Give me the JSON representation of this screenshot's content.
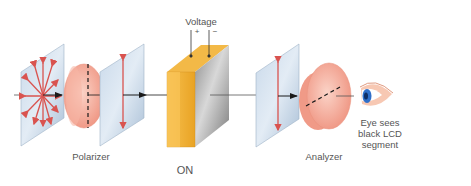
{
  "diagram": {
    "state_label": "ON",
    "labels": {
      "voltage": "Voltage",
      "plus": "+",
      "minus": "−",
      "polarizer": "Polarizer",
      "analyzer": "Analyzer",
      "eye_line1": "Eye sees",
      "eye_line2": "black LCD",
      "eye_line3": "segment"
    },
    "components": [
      {
        "name": "unpolarized-light-panel",
        "position": 1
      },
      {
        "name": "polarizer-lens",
        "axis": "vertical",
        "position": 2
      },
      {
        "name": "vertically-polarized-panel",
        "position": 3
      },
      {
        "name": "liquid-crystal-cell",
        "state": "voltage on",
        "position": 4
      },
      {
        "name": "vertically-polarized-panel-2",
        "position": 5
      },
      {
        "name": "analyzer-lens",
        "axis": "diagonal/horizontal",
        "position": 6
      },
      {
        "name": "eye",
        "position": 7
      }
    ],
    "colors": {
      "panel": "#b9cde0",
      "arrow": "#d9534f",
      "lens": "#f4a99a",
      "cell_edge": "#f2b035",
      "cell_face": "#a9a9a9",
      "eye_iris": "#2f6fc9"
    }
  }
}
